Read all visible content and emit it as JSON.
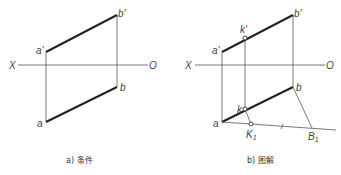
{
  "panels": [
    {
      "id": "a",
      "caption": "a) 条件",
      "axis": {
        "left_label": "X",
        "right_label": "O"
      },
      "points": {
        "a_prime": "a'",
        "b_prime": "b'",
        "a": "a",
        "b": "b"
      }
    },
    {
      "id": "b",
      "caption": "b) 图解",
      "axis": {
        "left_label": "X",
        "right_label": "O"
      },
      "points": {
        "a_prime": "a'",
        "b_prime": "b'",
        "k_prime": "k'",
        "a": "a",
        "b": "b",
        "k": "k",
        "K1": "K",
        "K1_sub": "1",
        "B1": "B",
        "B1_sub": "1"
      }
    }
  ]
}
